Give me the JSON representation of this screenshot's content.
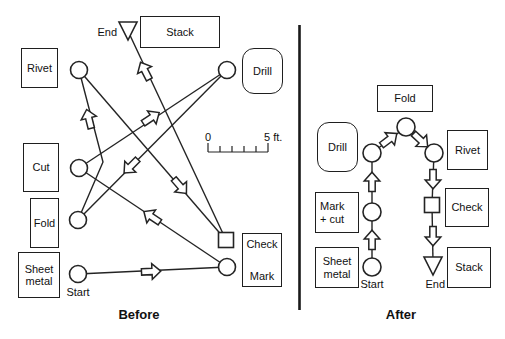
{
  "before": {
    "caption": "Before",
    "box_rivet": "Rivet",
    "box_stack": "Stack",
    "box_drill": "Drill",
    "box_cut": "Cut",
    "box_fold": "Fold",
    "box_sheet_line1": "Sheet",
    "box_sheet_line2": "metal",
    "box_check": "Check",
    "box_mark": "Mark",
    "label_end": "End",
    "label_start": "Start",
    "scale_zero": "0",
    "scale_five": "5 ft.",
    "flow_sequence": "Start (Sheet metal) → Mark → Cut → Drill → Fold → Rivet → Check → Stack (End)"
  },
  "after": {
    "caption": "After",
    "box_fold": "Fold",
    "box_drill": "Drill",
    "box_rivet": "Rivet",
    "box_mark_line1": "Mark",
    "box_mark_line2": "+ cut",
    "box_check": "Check",
    "box_sheet_line1": "Sheet",
    "box_sheet_line2": "metal",
    "box_stack": "Stack",
    "label_start": "Start",
    "label_end": "End",
    "flow_sequence": "Start (Sheet metal) → Mark + cut → Drill → Fold → Rivet → Check → Stack (End)"
  },
  "symbols": {
    "circle": "operation",
    "square": "inspection",
    "triangle": "storage",
    "block_arrow": "transport"
  },
  "colors": {
    "ink": "#242424",
    "background": "#ffffff"
  }
}
